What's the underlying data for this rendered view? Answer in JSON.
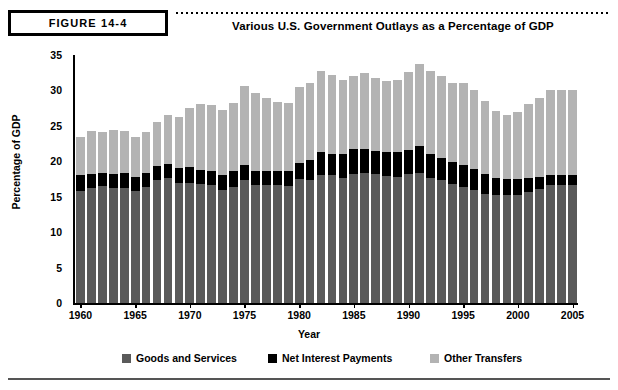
{
  "figure": {
    "label": "FIGURE 14-4",
    "title": "Various U.S. Government Outlays as a Percentage of GDP"
  },
  "legend": {
    "position": "bottom",
    "items": [
      {
        "label": "Goods and Services",
        "color": "#5a5a5a",
        "swatch_name": "legend-swatch-goods"
      },
      {
        "label": "Net Interest Payments",
        "color": "#000000",
        "swatch_name": "legend-swatch-interest"
      },
      {
        "label": "Other Transfers",
        "color": "#b3b3b3",
        "swatch_name": "legend-swatch-other"
      }
    ]
  },
  "chart_data": {
    "type": "bar",
    "stacked": true,
    "title": "Various U.S. Government Outlays as a Percentage of GDP",
    "xlabel": "Year",
    "ylabel": "Percentage of GDP",
    "ylim": [
      0,
      35
    ],
    "ytick_step": 5,
    "yticks": [
      0,
      5,
      10,
      15,
      20,
      25,
      30,
      35
    ],
    "xlim": [
      1960,
      2005
    ],
    "xticks": [
      1960,
      1965,
      1970,
      1975,
      1980,
      1985,
      1990,
      1995,
      2000,
      2005
    ],
    "grid": false,
    "categories": [
      1960,
      1961,
      1962,
      1963,
      1964,
      1965,
      1966,
      1967,
      1968,
      1969,
      1970,
      1971,
      1972,
      1973,
      1974,
      1975,
      1976,
      1977,
      1978,
      1979,
      1980,
      1981,
      1982,
      1983,
      1984,
      1985,
      1986,
      1987,
      1988,
      1989,
      1990,
      1991,
      1992,
      1993,
      1994,
      1995,
      1996,
      1997,
      1998,
      1999,
      2000,
      2001,
      2002,
      2003,
      2004,
      2005
    ],
    "series": [
      {
        "name": "Goods and Services",
        "color": "#5a5a5a",
        "values": [
          15.8,
          16.3,
          16.5,
          16.2,
          16.2,
          15.8,
          16.4,
          17.4,
          17.6,
          16.9,
          17.0,
          16.8,
          16.7,
          16.0,
          16.4,
          17.4,
          16.7,
          16.7,
          16.7,
          16.5,
          17.5,
          17.4,
          18.0,
          18.0,
          17.6,
          18.2,
          18.3,
          18.2,
          17.9,
          17.8,
          18.2,
          18.4,
          17.7,
          17.3,
          16.8,
          16.4,
          15.9,
          15.4,
          15.2,
          15.2,
          15.3,
          15.6,
          16.1,
          16.6,
          16.6,
          16.6
        ]
      },
      {
        "name": "Net Interest Payments",
        "color": "#000000",
        "values": [
          2.2,
          1.9,
          1.9,
          2.0,
          2.1,
          2.0,
          1.9,
          1.9,
          2.0,
          2.1,
          2.2,
          2.0,
          1.9,
          2.0,
          2.2,
          2.1,
          1.9,
          1.9,
          2.0,
          2.1,
          2.2,
          2.8,
          3.3,
          3.1,
          3.5,
          3.5,
          3.4,
          3.3,
          3.4,
          3.5,
          3.4,
          3.7,
          3.4,
          3.2,
          3.1,
          3.1,
          3.0,
          2.8,
          2.5,
          2.3,
          2.2,
          2.0,
          1.7,
          1.5,
          1.4,
          1.5
        ]
      },
      {
        "name": "Other Transfers",
        "color": "#b3b3b3",
        "values": [
          5.5,
          6.1,
          5.8,
          6.2,
          6.0,
          5.7,
          5.8,
          6.3,
          6.9,
          7.2,
          8.3,
          9.3,
          9.4,
          9.2,
          9.6,
          11.1,
          11.0,
          10.4,
          9.7,
          9.6,
          10.8,
          10.9,
          11.4,
          11.1,
          10.4,
          10.4,
          10.7,
          10.2,
          10.0,
          10.2,
          11.0,
          11.7,
          11.7,
          11.5,
          11.2,
          11.6,
          11.1,
          10.3,
          9.4,
          9.1,
          9.4,
          10.5,
          11.2,
          11.9,
          12.0,
          12.0
        ]
      }
    ]
  }
}
